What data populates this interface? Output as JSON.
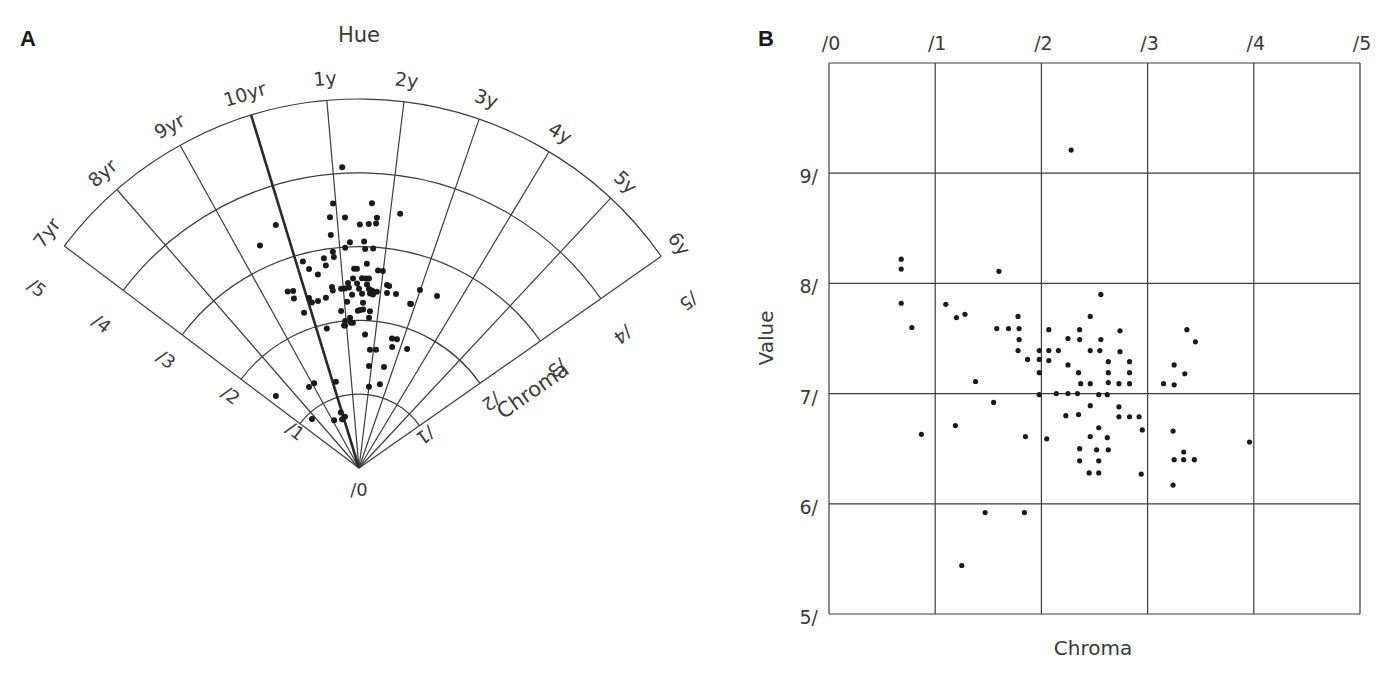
{
  "figure": {
    "panel_a_label": "A",
    "panel_b_label": "B"
  },
  "chart_data": [
    {
      "panel": "A",
      "type": "scatter",
      "subtype": "polar-sector",
      "title": "Hue",
      "angular_axis": {
        "label": "Hue",
        "ticks": [
          "7yr",
          "8yr",
          "9yr",
          "10yr",
          "1y",
          "2y",
          "3y",
          "4y",
          "5y",
          "6y"
        ],
        "tick_angles_deg": [
          -53,
          -41,
          -29,
          -17,
          -5,
          7,
          19,
          31,
          43,
          55
        ],
        "emphasized_tick": "10yr"
      },
      "radial_axis": {
        "label": "Chroma",
        "ticks": [
          "/0",
          "/1",
          "/2",
          "/3",
          "/4",
          "/5"
        ],
        "range": [
          0,
          5
        ]
      },
      "grid": true,
      "points_hue_deg_chroma": [
        [
          -3.2,
          4.08
        ],
        [
          -5.6,
          3.6
        ],
        [
          2.8,
          3.59
        ],
        [
          -6.6,
          3.42
        ],
        [
          -3.2,
          3.4
        ],
        [
          4.1,
          3.4
        ],
        [
          9.2,
          3.49
        ],
        [
          -18.9,
          3.48
        ],
        [
          0.2,
          3.3
        ],
        [
          2.3,
          3.31
        ],
        [
          4.0,
          3.32
        ],
        [
          -6.9,
          3.18
        ],
        [
          -24.0,
          3.3
        ],
        [
          -2.3,
          3.06
        ],
        [
          1.3,
          3.07
        ],
        [
          -3.6,
          2.99
        ],
        [
          1.6,
          2.97
        ],
        [
          3.7,
          2.98
        ],
        [
          -6.9,
          2.95
        ],
        [
          -6.8,
          2.88
        ],
        [
          -9.5,
          2.88
        ],
        [
          -15.2,
          2.9
        ],
        [
          -9.3,
          2.78
        ],
        [
          -14.1,
          2.78
        ],
        [
          2.2,
          2.77
        ],
        [
          -1.4,
          2.7
        ],
        [
          -0.6,
          2.7
        ],
        [
          5.5,
          2.69
        ],
        [
          6.9,
          2.69
        ],
        [
          -12.0,
          2.68
        ],
        [
          9.4,
          2.5
        ],
        [
          18.9,
          2.55
        ],
        [
          24.4,
          2.56
        ],
        [
          17.3,
          2.33
        ],
        [
          -22.0,
          2.58
        ],
        [
          -20.4,
          2.56
        ],
        [
          -21.0,
          2.46
        ],
        [
          -16.4,
          2.4
        ],
        [
          -15.9,
          2.33
        ],
        [
          -13.8,
          2.33
        ],
        [
          -11.0,
          2.35
        ],
        [
          -19.5,
          2.23
        ],
        [
          -8.5,
          2.48
        ],
        [
          -8.4,
          2.43
        ],
        [
          -5.7,
          2.44
        ],
        [
          -4.5,
          2.44
        ],
        [
          -3.4,
          2.51
        ],
        [
          -1.8,
          2.57
        ],
        [
          -0.6,
          2.5
        ],
        [
          0.9,
          2.57
        ],
        [
          2.1,
          2.57
        ],
        [
          3.0,
          2.57
        ],
        [
          -3.2,
          2.45
        ],
        [
          0.0,
          2.43
        ],
        [
          2.5,
          2.49
        ],
        [
          3.2,
          2.43
        ],
        [
          4.2,
          2.41
        ],
        [
          5.8,
          2.4
        ],
        [
          -2.3,
          2.35
        ],
        [
          1.0,
          2.36
        ],
        [
          3.6,
          2.37
        ],
        [
          4.6,
          2.36
        ],
        [
          -4.1,
          2.26
        ],
        [
          1.4,
          2.24
        ],
        [
          1.5,
          2.15
        ],
        [
          -0.4,
          2.13
        ],
        [
          4.0,
          2.13
        ],
        [
          -3.4,
          2.04
        ],
        [
          3.8,
          2.04
        ],
        [
          -2.4,
          1.97
        ],
        [
          -5.6,
          1.94
        ],
        [
          -13.0,
          1.94
        ],
        [
          2.6,
          1.81
        ],
        [
          8.7,
          2.51
        ],
        [
          9.1,
          2.4
        ],
        [
          12.0,
          2.41
        ],
        [
          17.6,
          2.33
        ],
        [
          14.3,
          1.81
        ],
        [
          16.4,
          1.82
        ],
        [
          15.3,
          1.7
        ],
        [
          22.0,
          1.74
        ],
        [
          -5.4,
          2.0
        ],
        [
          5.6,
          1.39
        ],
        [
          13.9,
          1.41
        ],
        [
          5.3,
          1.61
        ],
        [
          8.2,
          1.62
        ],
        [
          7.0,
          1.11
        ],
        [
          14.0,
          1.17
        ],
        [
          -49.1,
          1.49
        ],
        [
          -43.8,
          0.92
        ],
        [
          -31.7,
          1.29
        ],
        [
          -27.9,
          1.3
        ],
        [
          -15.0,
          1.21
        ],
        [
          -27.5,
          0.73
        ],
        [
          -18.1,
          0.79
        ],
        [
          -19.1,
          0.7
        ],
        [
          -15.4,
          0.72
        ],
        [
          -6.0,
          1.94
        ],
        [
          -3.2,
          1.97
        ],
        [
          -6.5,
          2.14
        ],
        [
          0.4,
          2.14
        ]
      ]
    },
    {
      "panel": "B",
      "type": "scatter",
      "title": "",
      "xlabel": "Chroma",
      "ylabel": "Value",
      "x_ticks": [
        "/0",
        "/1",
        "/2",
        "/3",
        "/4",
        "/5"
      ],
      "y_ticks": [
        "5/",
        "6/",
        "7/",
        "8/",
        "9/"
      ],
      "xlim": [
        0,
        5
      ],
      "ylim": [
        5,
        10
      ],
      "x_axis_position": "top",
      "grid": true,
      "points_chroma_value": [
        [
          2.28,
          9.21
        ],
        [
          0.68,
          8.22
        ],
        [
          0.68,
          8.13
        ],
        [
          1.6,
          8.11
        ],
        [
          0.68,
          7.82
        ],
        [
          0.78,
          7.6
        ],
        [
          1.1,
          7.81
        ],
        [
          1.2,
          7.69
        ],
        [
          1.28,
          7.72
        ],
        [
          1.78,
          7.7
        ],
        [
          1.58,
          7.59
        ],
        [
          1.69,
          7.59
        ],
        [
          1.79,
          7.59
        ],
        [
          1.79,
          7.49
        ],
        [
          1.78,
          7.39
        ],
        [
          1.87,
          7.31
        ],
        [
          1.98,
          7.39
        ],
        [
          1.98,
          7.31
        ],
        [
          1.98,
          7.19
        ],
        [
          1.38,
          7.11
        ],
        [
          2.07,
          7.58
        ],
        [
          2.07,
          7.39
        ],
        [
          2.16,
          7.39
        ],
        [
          2.07,
          7.3
        ],
        [
          2.25,
          7.26
        ],
        [
          2.25,
          7.5
        ],
        [
          2.36,
          7.58
        ],
        [
          2.36,
          7.49
        ],
        [
          2.35,
          7.19
        ],
        [
          2.37,
          7.09
        ],
        [
          1.98,
          6.99
        ],
        [
          2.14,
          7.0
        ],
        [
          2.25,
          7.0
        ],
        [
          2.34,
          7.0
        ],
        [
          2.56,
          7.9
        ],
        [
          2.46,
          7.7
        ],
        [
          2.74,
          7.57
        ],
        [
          2.56,
          7.49
        ],
        [
          2.46,
          7.39
        ],
        [
          2.55,
          7.39
        ],
        [
          2.74,
          7.38
        ],
        [
          2.63,
          7.29
        ],
        [
          2.83,
          7.29
        ],
        [
          2.63,
          7.19
        ],
        [
          2.83,
          7.19
        ],
        [
          2.46,
          7.09
        ],
        [
          2.63,
          7.1
        ],
        [
          2.73,
          7.09
        ],
        [
          2.83,
          7.09
        ],
        [
          3.37,
          7.58
        ],
        [
          3.45,
          7.47
        ],
        [
          3.25,
          7.26
        ],
        [
          3.35,
          7.18
        ],
        [
          3.15,
          7.09
        ],
        [
          3.25,
          7.08
        ],
        [
          2.54,
          6.99
        ],
        [
          2.62,
          6.99
        ],
        [
          0.87,
          6.63
        ],
        [
          1.19,
          6.71
        ],
        [
          1.55,
          6.92
        ],
        [
          1.85,
          6.61
        ],
        [
          2.05,
          6.59
        ],
        [
          2.46,
          6.89
        ],
        [
          2.73,
          6.88
        ],
        [
          2.23,
          6.8
        ],
        [
          2.35,
          6.81
        ],
        [
          2.73,
          6.79
        ],
        [
          2.83,
          6.79
        ],
        [
          2.92,
          6.79
        ],
        [
          2.54,
          6.69
        ],
        [
          2.95,
          6.67
        ],
        [
          2.46,
          6.61
        ],
        [
          2.62,
          6.6
        ],
        [
          2.36,
          6.5
        ],
        [
          2.52,
          6.49
        ],
        [
          2.63,
          6.49
        ],
        [
          2.36,
          6.39
        ],
        [
          2.54,
          6.39
        ],
        [
          2.45,
          6.28
        ],
        [
          2.54,
          6.28
        ],
        [
          2.94,
          6.27
        ],
        [
          3.24,
          6.66
        ],
        [
          3.34,
          6.47
        ],
        [
          3.25,
          6.4
        ],
        [
          3.34,
          6.4
        ],
        [
          3.44,
          6.4
        ],
        [
          3.24,
          6.17
        ],
        [
          3.96,
          6.56
        ],
        [
          1.47,
          5.92
        ],
        [
          1.84,
          5.92
        ],
        [
          1.25,
          5.44
        ]
      ]
    }
  ]
}
